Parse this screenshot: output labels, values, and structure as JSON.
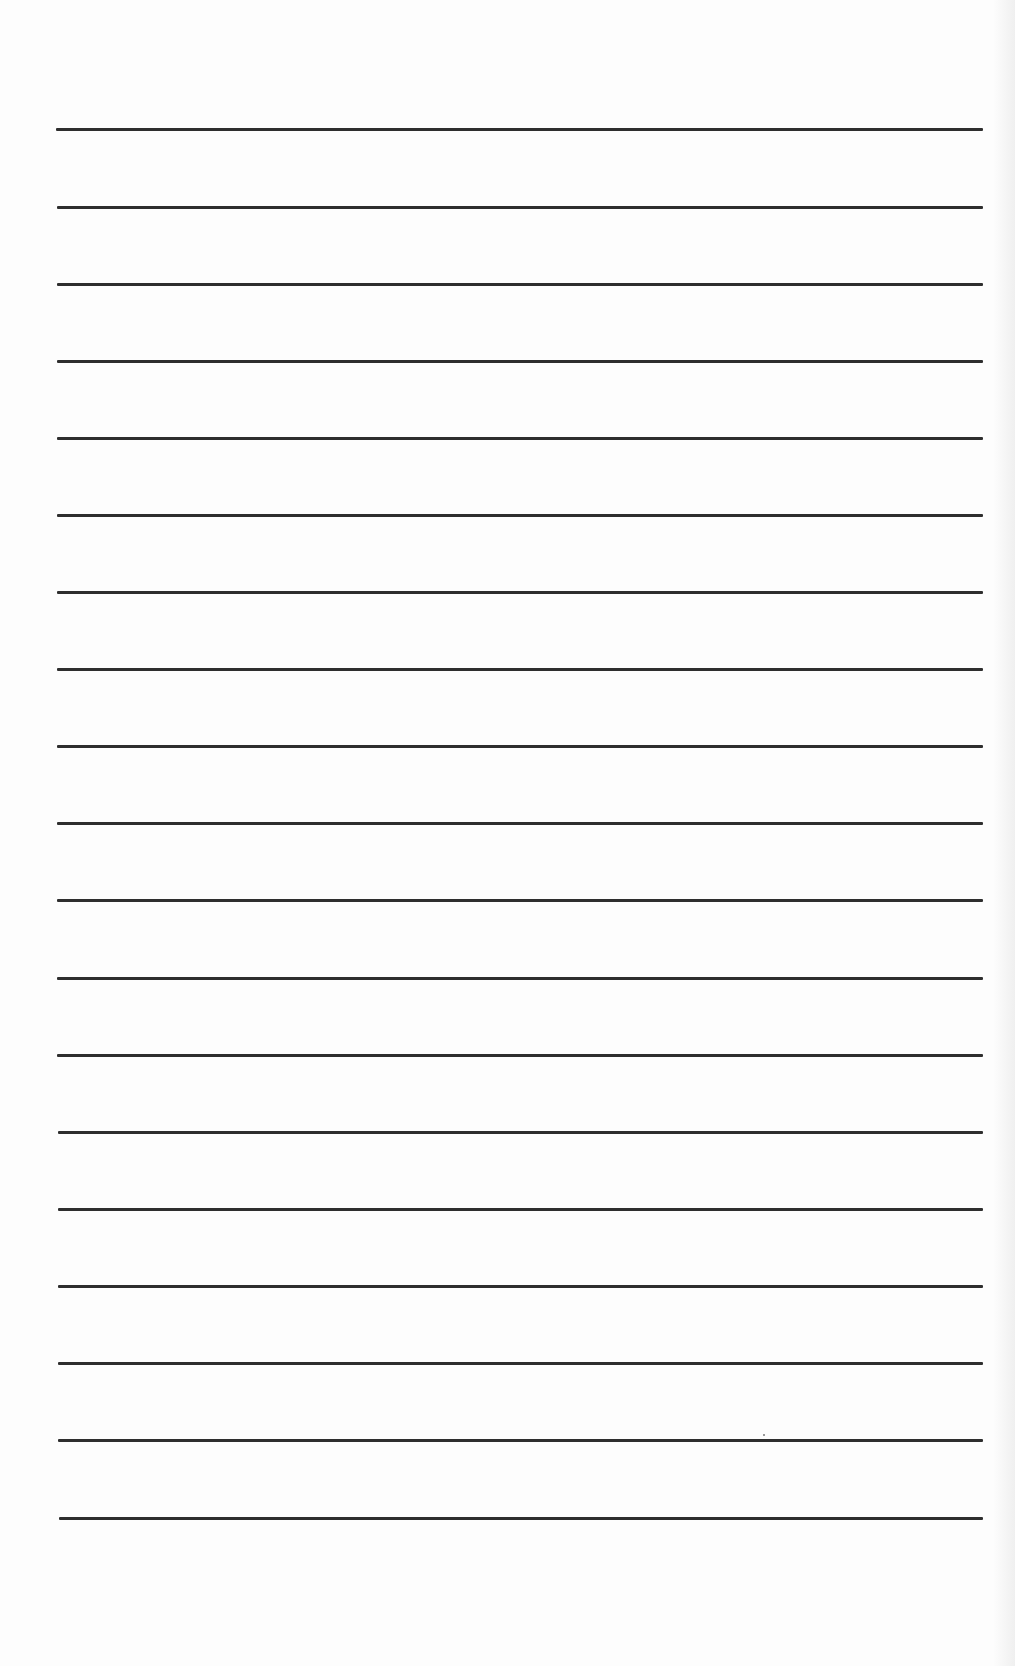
{
  "page": {
    "type": "lined-paper",
    "background_color": "#fdfdfd",
    "line_color": "#2e2e2e",
    "line_count": 19,
    "lines": [
      {
        "y": 129,
        "x1": 56,
        "x2": 983
      },
      {
        "y": 207,
        "x1": 57,
        "x2": 983
      },
      {
        "y": 284,
        "x1": 57,
        "x2": 983
      },
      {
        "y": 361,
        "x1": 57,
        "x2": 983
      },
      {
        "y": 438,
        "x1": 57,
        "x2": 983
      },
      {
        "y": 515,
        "x1": 57,
        "x2": 983
      },
      {
        "y": 592,
        "x1": 57,
        "x2": 983
      },
      {
        "y": 669,
        "x1": 57,
        "x2": 983
      },
      {
        "y": 746,
        "x1": 57,
        "x2": 983
      },
      {
        "y": 823,
        "x1": 57,
        "x2": 983
      },
      {
        "y": 900,
        "x1": 57,
        "x2": 983
      },
      {
        "y": 978,
        "x1": 57,
        "x2": 983
      },
      {
        "y": 1055,
        "x1": 57,
        "x2": 983
      },
      {
        "y": 1132,
        "x1": 58,
        "x2": 983
      },
      {
        "y": 1209,
        "x1": 58,
        "x2": 983
      },
      {
        "y": 1286,
        "x1": 58,
        "x2": 983
      },
      {
        "y": 1363,
        "x1": 58,
        "x2": 983
      },
      {
        "y": 1440,
        "x1": 58,
        "x2": 983
      },
      {
        "y": 1518,
        "x1": 59,
        "x2": 983
      }
    ],
    "text_content": ""
  }
}
